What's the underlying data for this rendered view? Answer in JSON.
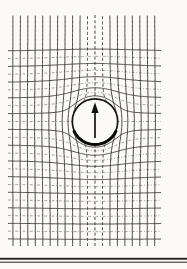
{
  "diagram": {
    "width": 187,
    "height": 269,
    "background": "#fbfaf7",
    "clip": {
      "x0": 8,
      "x1": 161,
      "y0": 15,
      "y1": 246
    },
    "center": {
      "x": 95,
      "y": 121.5
    },
    "scale": {
      "x": 7.45,
      "y": 7.8
    },
    "sphere": {
      "radius_units": 2.91,
      "radius_px": 22.7,
      "stroke": "#161616",
      "stroke_width": 1.7,
      "lower_arc": {
        "radius_px": 23.1,
        "start_deg": 115,
        "end_deg": 245,
        "stroke": "#0a0a0a",
        "stroke_width": 3.0
      }
    },
    "model": {
      "m_field": 7.39,
      "m_potential": 24.64,
      "u_max": 13,
      "v_guard": 17
    },
    "field_lines": {
      "k_min": -11,
      "k_max": 8,
      "dashed_k": [
        -1,
        0,
        1
      ],
      "solid": {
        "color": "#2e2e2e",
        "width": 0.95
      },
      "dashed": {
        "color": "#343434",
        "width": 0.95,
        "dash": "3 2.2"
      },
      "step_units": 0.165
    },
    "equipotentials": {
      "k_min": -15,
      "k_max": 9,
      "dashed_parity": "even",
      "solid": {
        "color": "#2e2e2e",
        "width": 0.9
      },
      "dashed": {
        "color": "#878787",
        "width": 0.85,
        "dash": "2.8 1.8 0.9 1.8"
      },
      "samples": 160
    },
    "arrow": {
      "x": 95,
      "shaft_y1": 138,
      "shaft_y2": 109.5,
      "shaft_width": 1.7,
      "head": {
        "tip_y": 102.3,
        "base_y": 113,
        "half_width": 3.6
      },
      "color": "#111111"
    },
    "rules": [
      {
        "x": 0,
        "y": 257.8,
        "width": 187,
        "height": 1.9,
        "color": "#262626"
      },
      {
        "x": 0,
        "y": 261.7,
        "width": 187,
        "height": 1.0,
        "color": "#262626"
      }
    ]
  }
}
